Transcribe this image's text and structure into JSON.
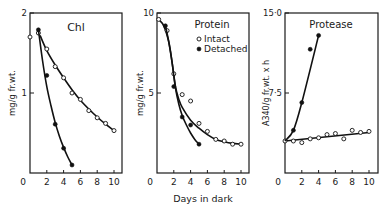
{
  "figure": {
    "shared_xlabel": "Days in dark",
    "legend": {
      "intact_label": "Intact",
      "detached_label": "Detached"
    }
  },
  "chart_data": [
    {
      "type": "line",
      "title": "Chl",
      "xlabel": "",
      "ylabel": "mg/g fr.wt.",
      "xlim": [
        0,
        11
      ],
      "ylim": [
        0,
        2
      ],
      "xticks": [
        0,
        2,
        4,
        6,
        8,
        10
      ],
      "yticks": [
        {
          "value": 1,
          "label": "1"
        },
        {
          "value": 2,
          "label": "2"
        }
      ],
      "grid": false,
      "series": [
        {
          "name": "Intact",
          "marker": "open-circle",
          "x": [
            0,
            1,
            2,
            3,
            4,
            5,
            6,
            7,
            8,
            9,
            10
          ],
          "values": [
            1.7,
            1.75,
            1.55,
            1.33,
            1.19,
            1.0,
            0.92,
            0.78,
            0.69,
            0.62,
            0.53
          ],
          "fit_x": [
            1.2,
            2,
            3,
            4,
            5,
            6,
            7,
            8,
            9,
            10
          ],
          "fit_y": [
            1.72,
            1.53,
            1.35,
            1.19,
            1.04,
            0.91,
            0.8,
            0.7,
            0.61,
            0.53
          ]
        },
        {
          "name": "Detached",
          "marker": "filled-circle",
          "x": [
            1,
            2,
            3,
            4,
            5
          ],
          "values": [
            1.79,
            1.22,
            0.61,
            0.31,
            0.1
          ],
          "fit_x": [
            1.0,
            1.5,
            2,
            2.5,
            3,
            3.5,
            4,
            4.5,
            5
          ],
          "fit_y": [
            1.79,
            1.4,
            1.08,
            0.84,
            0.63,
            0.46,
            0.32,
            0.2,
            0.1
          ]
        }
      ]
    },
    {
      "type": "line",
      "title": "Protein",
      "xlabel": "Days in dark",
      "ylabel": "mg/g fr.wt.",
      "xlim": [
        0,
        11
      ],
      "ylim": [
        0,
        10
      ],
      "xticks": [
        0,
        2,
        4,
        6,
        8,
        10
      ],
      "yticks": [
        {
          "value": 5,
          "label": "5"
        },
        {
          "value": 10,
          "label": "10"
        }
      ],
      "grid": false,
      "legend_position": "upper right",
      "series": [
        {
          "name": "Intact",
          "marker": "open-circle",
          "x": [
            0.2,
            1.2,
            2,
            3,
            4,
            5,
            6,
            7,
            8,
            9,
            10
          ],
          "values": [
            9.6,
            8.9,
            6.2,
            4.9,
            4.5,
            3.1,
            2.6,
            2.1,
            2.0,
            1.8,
            1.8
          ],
          "fit_x": [
            0.2,
            0.8,
            1.4,
            1.8,
            2.2,
            2.6,
            3,
            4,
            5,
            6,
            7,
            8,
            9,
            10
          ],
          "fit_y": [
            9.6,
            9.2,
            8.2,
            6.9,
            5.4,
            4.6,
            4.1,
            3.3,
            2.8,
            2.4,
            2.1,
            1.95,
            1.85,
            1.8
          ]
        },
        {
          "name": "Detached",
          "marker": "filled-circle",
          "x": [
            1,
            2,
            3,
            4,
            5
          ],
          "values": [
            9.2,
            5.4,
            3.5,
            3.0,
            1.8
          ],
          "fit_x": [
            1,
            1.4,
            1.8,
            2.2,
            2.6,
            3,
            3.5,
            4,
            4.5,
            5
          ],
          "fit_y": [
            9.2,
            8.2,
            6.9,
            5.3,
            4.3,
            3.6,
            3.0,
            2.5,
            2.1,
            1.8
          ]
        }
      ]
    },
    {
      "type": "line",
      "title": "Protease",
      "xlabel": "",
      "ylabel": "A340/g fr.wt. x h",
      "xlim": [
        0,
        11
      ],
      "ylim": [
        0,
        15
      ],
      "xticks": [
        0,
        2,
        4,
        6,
        8,
        10
      ],
      "yticks": [
        {
          "value": 7.5,
          "label": "7·5"
        },
        {
          "value": 15,
          "label": "15·0"
        }
      ],
      "grid": false,
      "series": [
        {
          "name": "Intact",
          "marker": "open-circle",
          "x": [
            0,
            1,
            2,
            3,
            4,
            5,
            6,
            7,
            8,
            9,
            10
          ],
          "values": [
            3.0,
            3.0,
            2.85,
            3.2,
            3.3,
            3.6,
            3.7,
            3.2,
            4.0,
            3.8,
            3.9
          ],
          "fit_x": [
            0,
            10
          ],
          "fit_y": [
            3.0,
            3.8
          ]
        },
        {
          "name": "Detached",
          "marker": "filled-circle",
          "x": [
            1,
            2,
            3,
            4
          ],
          "values": [
            4.0,
            6.6,
            11.6,
            12.9
          ],
          "fit_x": [
            0,
            1,
            2,
            4
          ],
          "fit_y": [
            3.0,
            4.0,
            6.6,
            12.9
          ]
        }
      ]
    }
  ]
}
